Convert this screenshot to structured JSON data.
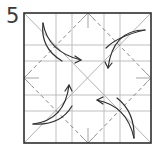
{
  "diagram": {
    "type": "origami-step",
    "step_number": "5",
    "colors": {
      "border": "#2e2e2e",
      "crease": "#b8b8b8",
      "valley_fold": "#7a7a7a",
      "arrow": "#2e2e2e",
      "step_number": "#3a3a3a"
    },
    "arrows": [
      {
        "corner": "top-left",
        "direction": "fold toward center"
      },
      {
        "corner": "top-right",
        "direction": "fold toward center"
      },
      {
        "corner": "bottom-left",
        "direction": "fold toward center"
      },
      {
        "corner": "bottom-right",
        "direction": "fold toward center"
      }
    ]
  }
}
